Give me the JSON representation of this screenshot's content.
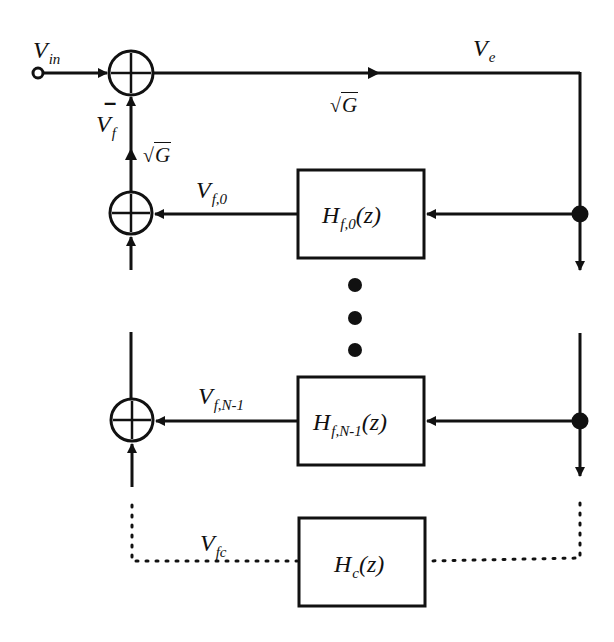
{
  "diagram": {
    "type": "block-diagram",
    "colors": {
      "stroke": "#111111",
      "background": "#ffffff"
    },
    "signals": {
      "input": {
        "main": "V",
        "sub": "in"
      },
      "error": {
        "main": "V",
        "sub": "e"
      },
      "feedback": {
        "main": "V",
        "sub": "f"
      },
      "feedback_0": {
        "main": "V",
        "sub": "f,0"
      },
      "feedback_n1": {
        "main": "V",
        "sub": "f,N-1"
      },
      "feedback_c": {
        "main": "V",
        "sub": "fc"
      }
    },
    "gains": {
      "forward": {
        "radical": "√",
        "arg": "G"
      },
      "feedback": {
        "radical": "√",
        "arg": "G"
      }
    },
    "sign_labels": {
      "minus": "–"
    },
    "blocks": [
      {
        "id": "filter-0",
        "main": "H",
        "sub": "f,0",
        "tail": "(z)"
      },
      {
        "id": "filter-n1",
        "main": "H",
        "sub": "f,N-1",
        "tail": "(z)"
      },
      {
        "id": "filter-c",
        "main": "H",
        "sub": "c",
        "tail": "(z)"
      }
    ],
    "summing_junctions": [
      {
        "id": "sum-main",
        "symbol": "+"
      },
      {
        "id": "sum-0",
        "symbol": "+"
      },
      {
        "id": "sum-n1",
        "symbol": "+"
      }
    ],
    "ellipsis": "⋮"
  }
}
